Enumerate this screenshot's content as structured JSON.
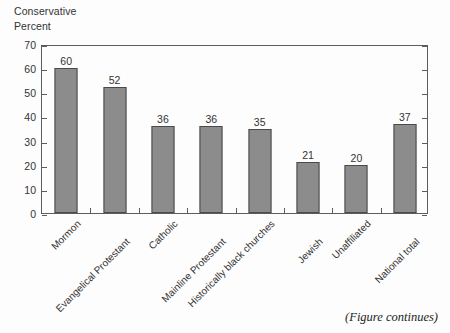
{
  "header": {
    "line1": "Conservative",
    "line2": "Percent"
  },
  "footer": {
    "note": "(Figure continues)"
  },
  "colors": {
    "bar_fill": "#8c8c8c",
    "bar_border": "#4a4a4a",
    "axis": "#5d5d5d",
    "text": "#333333",
    "background": "#fdfdfd"
  },
  "chart_data": {
    "type": "bar",
    "title": "Conservative",
    "subtitle": "Percent",
    "xlabel": "",
    "ylabel": "Percent",
    "ylim": [
      0,
      70
    ],
    "ytick_step": 10,
    "yticks": [
      0,
      10,
      20,
      30,
      40,
      50,
      60,
      70
    ],
    "grid": false,
    "legend": false,
    "categories": [
      "Mormon",
      "Evangelical Protestant",
      "Catholic",
      "Mainline Protestant",
      "Historically black churches",
      "Jewish",
      "Unaffiliated",
      "National total"
    ],
    "values": [
      60,
      52,
      36,
      36,
      35,
      21,
      20,
      37
    ],
    "data_labels": [
      "60",
      "52",
      "36",
      "36",
      "35",
      "21",
      "20",
      "37"
    ],
    "annotations": [
      "(Figure continues)"
    ]
  }
}
